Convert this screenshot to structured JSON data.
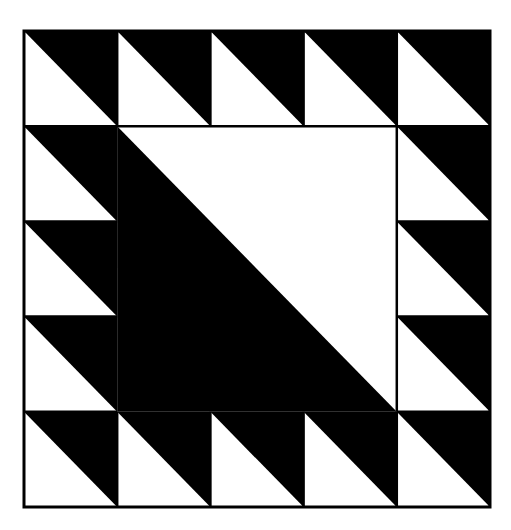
{
  "diagram": {
    "type": "half-square-triangle quilt block",
    "grid": {
      "rows": 5,
      "cols": 5
    },
    "colors": {
      "dark": "#000000",
      "light": "#ffffff",
      "line": "#000000"
    },
    "frame": {
      "x": 24,
      "y": 31,
      "width": 466,
      "height": 476
    },
    "border_cells": "half-square triangles, diagonal top-left to bottom-right, dark upper-right, light lower-left",
    "center": "3x3 square split by diagonal, light upper-right, dark lower-left"
  }
}
